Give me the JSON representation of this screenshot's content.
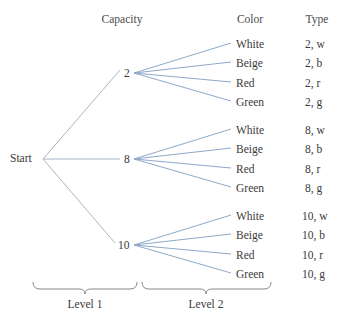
{
  "figure": {
    "kind": "probability-tree-diagram",
    "edge_color_branch": "#8da9c9",
    "edge_color_trunk": "#aab6c4",
    "bracket_color": "#8a8a8a",
    "text_color": "#3a3a3a"
  },
  "headers": [
    {
      "label": "Capacity",
      "x": 122,
      "y": 14
    },
    {
      "label": "Color",
      "x": 250,
      "y": 14
    },
    {
      "label": "Type",
      "x": 317,
      "y": 14
    }
  ],
  "root": {
    "label": "Start",
    "x": 10,
    "y": 153,
    "fan_x": 43,
    "fan_y": 159
  },
  "level1": [
    {
      "label": "2",
      "label_x": 124,
      "label_y": 68,
      "fan_x": 134,
      "fan_y": 73
    },
    {
      "label": "8",
      "label_x": 124,
      "label_y": 154,
      "fan_x": 134,
      "fan_y": 159
    },
    {
      "label": "10",
      "label_x": 118,
      "label_y": 240,
      "fan_x": 134,
      "fan_y": 245
    }
  ],
  "level2": [
    {
      "label": "White",
      "y": 45
    },
    {
      "label": "Beige",
      "y": 64
    },
    {
      "label": "Red",
      "y": 84
    },
    {
      "label": "Green",
      "y": 103
    },
    {
      "label": "White",
      "y": 131
    },
    {
      "label": "Beige",
      "y": 150
    },
    {
      "label": "Red",
      "y": 170
    },
    {
      "label": "Green",
      "y": 189
    },
    {
      "label": "White",
      "y": 217
    },
    {
      "label": "Beige",
      "y": 236
    },
    {
      "label": "Red",
      "y": 256
    },
    {
      "label": "Green",
      "y": 275
    }
  ],
  "types": [
    {
      "label": "2, w",
      "y": 45
    },
    {
      "label": "2, b",
      "y": 64
    },
    {
      "label": "2, r",
      "y": 84
    },
    {
      "label": "2, g",
      "y": 103
    },
    {
      "label": "8, w",
      "y": 131
    },
    {
      "label": "8, b",
      "y": 150
    },
    {
      "label": "8, r",
      "y": 170
    },
    {
      "label": "8, g",
      "y": 189
    },
    {
      "label": "10, w",
      "y": 217
    },
    {
      "label": "10, b",
      "y": 236
    },
    {
      "label": "10, r",
      "y": 256
    },
    {
      "label": "10, g",
      "y": 275
    }
  ],
  "brackets": [
    {
      "label": "Level 1",
      "x1": 33,
      "x2": 137,
      "y": 288,
      "label_x": 85,
      "label_y": 301
    },
    {
      "label": "Level 2",
      "x1": 142,
      "x2": 271,
      "y": 288,
      "label_x": 206,
      "label_y": 301
    }
  ]
}
